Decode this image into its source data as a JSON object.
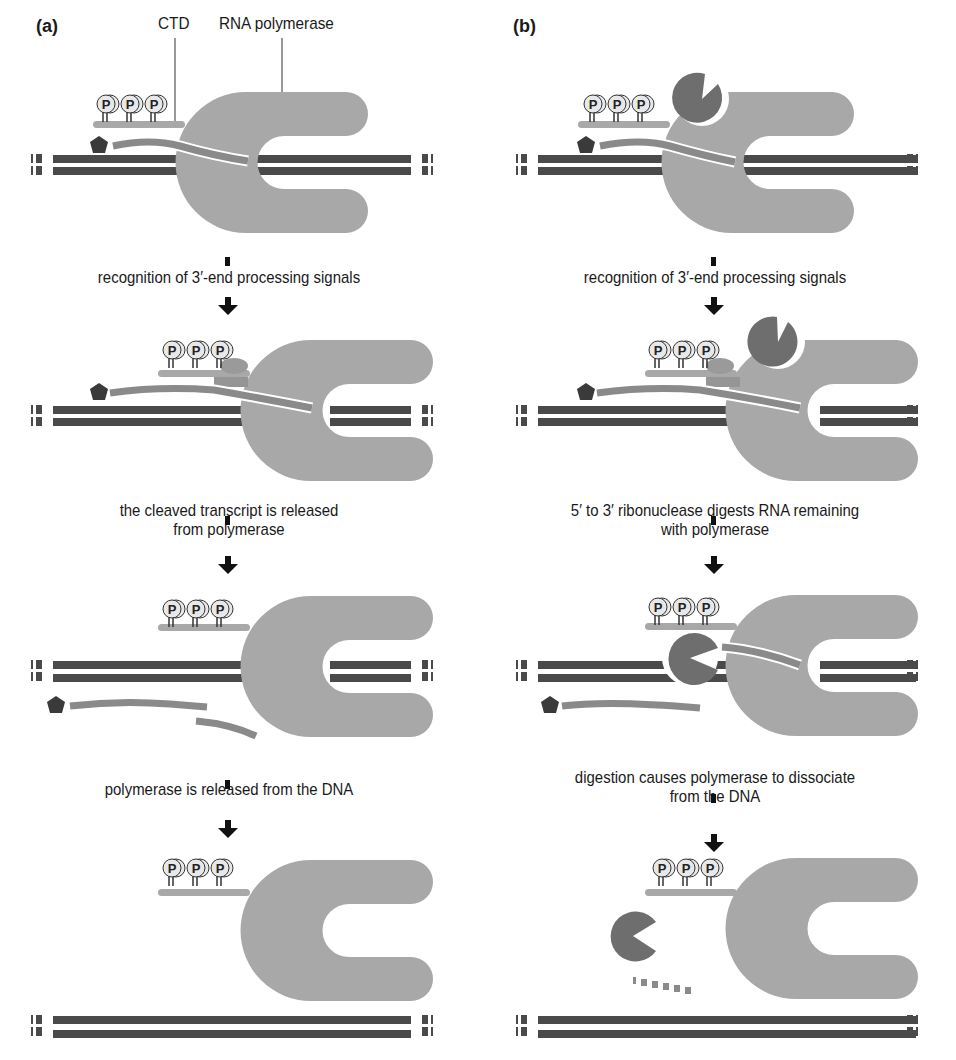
{
  "panels": {
    "a": {
      "label": "(a)",
      "annotations": {
        "ctd": "CTD",
        "rnap": "RNA polymerase"
      },
      "steps": [
        "recognition of 3′-end processing signals",
        "the cleaved transcript is released",
        "from polymerase",
        "polymerase is released from the DNA"
      ]
    },
    "b": {
      "label": "(b)",
      "steps": [
        "recognition of 3′-end processing signals",
        "5′ to 3′ ribonuclease digests RNA remaining",
        "with polymerase",
        "digestion causes polymerase to dissociate",
        "from the DNA"
      ]
    }
  },
  "phosphate_label": "P",
  "colors": {
    "polymerase": "#a8a8a8",
    "dna": "#4a4a4a",
    "rna": "#8a8a8a",
    "exonuclease": "#6e6e6e",
    "cap": "#3a3a3a",
    "arrow": "#111111"
  }
}
